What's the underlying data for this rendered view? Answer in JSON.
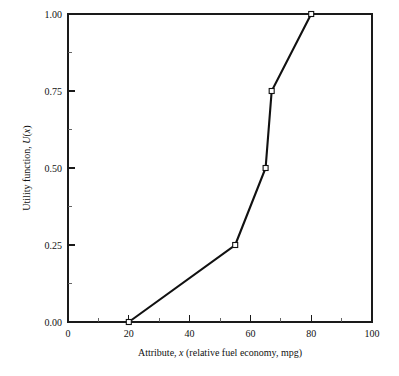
{
  "chart_data": {
    "type": "line",
    "title": "",
    "xlabel": "Attribute, x (relative fuel economy, mpg)",
    "xlabel_parts": {
      "pre": "Attribute, ",
      "italic": "x",
      "post": " (relative fuel economy, mpg)"
    },
    "ylabel": "Utility function, U(x)",
    "ylabel_parts": {
      "pre": "Utility function, ",
      "italic_u": "U",
      "mid": "(",
      "italic_x": "x",
      "post": ")"
    },
    "x": [
      20,
      55,
      65,
      67,
      80
    ],
    "values": [
      0.0,
      0.25,
      0.5,
      0.75,
      1.0
    ],
    "points": [
      {
        "x": 20,
        "y": 0.0
      },
      {
        "x": 55,
        "y": 0.25
      },
      {
        "x": 65,
        "y": 0.5
      },
      {
        "x": 67,
        "y": 0.75
      },
      {
        "x": 80,
        "y": 1.0
      }
    ],
    "xlim": [
      0,
      100
    ],
    "ylim": [
      0.0,
      1.0
    ],
    "xticks": [
      0,
      20,
      40,
      60,
      80,
      100
    ],
    "xtick_labels": [
      "0",
      "20",
      "40",
      "60",
      "80",
      "100"
    ],
    "xticks_minor": [
      10,
      30,
      50,
      70,
      90
    ],
    "yticks": [
      0.0,
      0.25,
      0.5,
      0.75,
      1.0
    ],
    "ytick_labels": [
      "0.00",
      "0.25",
      "0.50",
      "0.75",
      "1.00"
    ],
    "yticks_minor": [
      0.125,
      0.375,
      0.625,
      0.875
    ],
    "grid": false,
    "legend": null,
    "marker": "open-square",
    "line_color": "#111111",
    "marker_fill": "#ffffff",
    "marker_edge": "#111111",
    "background": "#ffffff"
  },
  "ytick_label_text": {
    "t0": "0.00",
    "t1": "0.25",
    "t2": "0.50",
    "t3": "0.75",
    "t4": "1.00"
  },
  "xtick_label_text": {
    "t0": "0",
    "t1": "20",
    "t2": "40",
    "t3": "60",
    "t4": "80",
    "t5": "100"
  }
}
